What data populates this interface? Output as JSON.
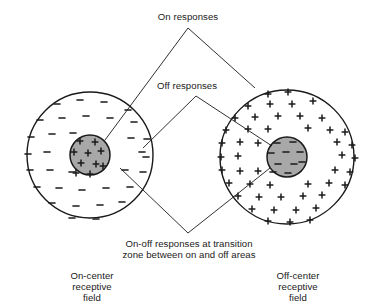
{
  "figure": {
    "type": "diagram",
    "background_color": "#ffffff",
    "line_color": "#1a1a1a",
    "center_fill_color": "#a8a8a8",
    "surround_fill_color": "#ffffff"
  },
  "labels": {
    "on_responses": "On responses",
    "off_responses": "Off responses",
    "on_off_responses_line1": "On-off responses at transition",
    "on_off_responses_line2": "zone between on and off areas",
    "left_field_line1": "On-center",
    "left_field_line2": "receptive",
    "left_field_line3": "field",
    "right_field_line1": "Off-center",
    "right_field_line2": "receptive",
    "right_field_line3": "field"
  },
  "fields": [
    {
      "name": "on-center-receptive-field",
      "cx": 90,
      "cy": 155,
      "radius": 63,
      "center_radius": 20,
      "center_sign": "+",
      "surround_sign": "−",
      "center_fill": "#a8a8a8",
      "surround_fill": "#ffffff"
    },
    {
      "name": "off-center-receptive-field",
      "cx": 287,
      "cy": 157,
      "radius": 67,
      "center_radius": 20,
      "center_sign": "−",
      "surround_sign": "+",
      "center_fill": "#a8a8a8",
      "surround_fill": "#ffffff"
    }
  ],
  "leader_lines": {
    "on_responses": {
      "apex": [
        188,
        28
      ],
      "left_end": [
        105,
        140
      ],
      "right_end": [
        255,
        88
      ]
    },
    "off_responses": {
      "apex": [
        196,
        96
      ],
      "left_end": [
        143,
        148
      ],
      "right_end": [
        272,
        146
      ]
    },
    "on_off_responses": {
      "apex": [
        188,
        233
      ],
      "left_end": [
        120,
        168
      ],
      "right_end": [
        270,
        168
      ]
    }
  },
  "marks": {
    "left_surround": [
      [
        57,
        104
      ],
      [
        80,
        100
      ],
      [
        104,
        102
      ],
      [
        128,
        110
      ],
      [
        40,
        120
      ],
      [
        62,
        118
      ],
      [
        86,
        116
      ],
      [
        110,
        118
      ],
      [
        134,
        122
      ],
      [
        31,
        137
      ],
      [
        52,
        134
      ],
      [
        73,
        133
      ],
      [
        131,
        138
      ],
      [
        147,
        139
      ],
      [
        28,
        154
      ],
      [
        47,
        152
      ],
      [
        142,
        152
      ],
      [
        146,
        157
      ],
      [
        30,
        170
      ],
      [
        50,
        170
      ],
      [
        72,
        172
      ],
      [
        125,
        170
      ],
      [
        143,
        172
      ],
      [
        37,
        187
      ],
      [
        59,
        188
      ],
      [
        82,
        190
      ],
      [
        106,
        188
      ],
      [
        130,
        187
      ],
      [
        52,
        203
      ],
      [
        76,
        206
      ],
      [
        100,
        205
      ],
      [
        122,
        202
      ],
      [
        72,
        218
      ],
      [
        96,
        219
      ]
    ],
    "left_center": [
      [
        80,
        141
      ],
      [
        95,
        142
      ],
      [
        74,
        152
      ],
      [
        88,
        153
      ],
      [
        101,
        151
      ],
      [
        81,
        163
      ],
      [
        96,
        164
      ],
      [
        76,
        173
      ],
      [
        90,
        174
      ],
      [
        103,
        166
      ]
    ],
    "right_surround": [
      [
        268,
        94
      ],
      [
        288,
        92
      ],
      [
        248,
        106
      ],
      [
        270,
        104
      ],
      [
        292,
        104
      ],
      [
        313,
        101
      ],
      [
        235,
        118
      ],
      [
        255,
        117
      ],
      [
        278,
        116
      ],
      [
        300,
        116
      ],
      [
        322,
        118
      ],
      [
        226,
        130
      ],
      [
        248,
        129
      ],
      [
        268,
        129
      ],
      [
        308,
        128
      ],
      [
        330,
        130
      ],
      [
        345,
        132
      ],
      [
        222,
        143
      ],
      [
        240,
        142
      ],
      [
        258,
        143
      ],
      [
        337,
        142
      ],
      [
        352,
        145
      ],
      [
        221,
        157
      ],
      [
        238,
        156
      ],
      [
        342,
        155
      ],
      [
        355,
        158
      ],
      [
        222,
        170
      ],
      [
        240,
        171
      ],
      [
        258,
        171
      ],
      [
        335,
        170
      ],
      [
        350,
        172
      ],
      [
        229,
        183
      ],
      [
        250,
        184
      ],
      [
        270,
        185
      ],
      [
        308,
        184
      ],
      [
        329,
        183
      ],
      [
        345,
        185
      ],
      [
        238,
        196
      ],
      [
        259,
        197
      ],
      [
        281,
        197
      ],
      [
        303,
        196
      ],
      [
        322,
        195
      ],
      [
        252,
        209
      ],
      [
        274,
        210
      ],
      [
        296,
        210
      ],
      [
        316,
        208
      ],
      [
        268,
        221
      ],
      [
        290,
        222
      ],
      [
        310,
        220
      ]
    ],
    "right_center": [
      [
        277,
        143
      ],
      [
        293,
        142
      ],
      [
        271,
        153
      ],
      [
        286,
        152
      ],
      [
        300,
        152
      ],
      [
        278,
        164
      ],
      [
        294,
        164
      ],
      [
        273,
        172
      ],
      [
        288,
        173
      ],
      [
        302,
        162
      ]
    ]
  }
}
